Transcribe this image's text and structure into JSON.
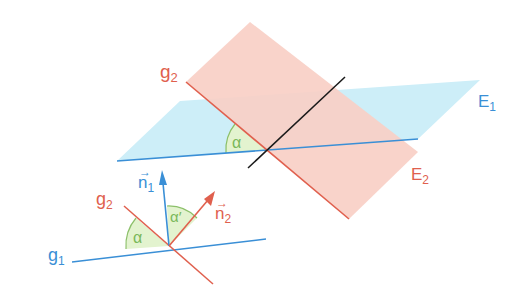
{
  "diagram": {
    "colors": {
      "plane_e1_fill": "#cdeef8",
      "plane_e2_fill": "#f9cfc6",
      "line_blue": "#3a8fd6",
      "line_red": "#e0604e",
      "line_black": "#1a1a1a",
      "angle_fill": "#e3f3cf",
      "angle_stroke": "#8cc06a",
      "label_green": "#7ab85a"
    },
    "labels": {
      "g2_top": "g",
      "g2_top_sub": "2",
      "e1": "E",
      "e1_sub": "1",
      "e2": "E",
      "e2_sub": "2",
      "alpha_top": "α",
      "n1": "n",
      "n1_sub": "1",
      "n2": "n",
      "n2_sub": "2",
      "g2_bottom": "g",
      "g2_bottom_sub": "2",
      "g1": "g",
      "g1_sub": "1",
      "alpha_bottom": "α",
      "alpha_prime": "α′"
    }
  }
}
